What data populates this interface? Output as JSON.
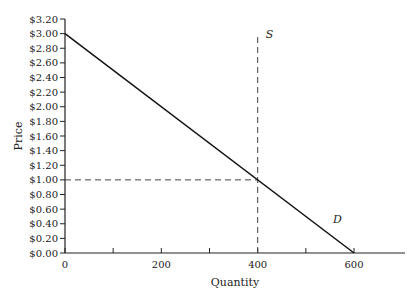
{
  "chart_data": {
    "type": "line",
    "title": "",
    "xlabel": "Quantity",
    "ylabel": "Price",
    "xlim": [
      0,
      700
    ],
    "ylim": [
      0,
      3.2
    ],
    "x_ticks": [
      0,
      100,
      200,
      300,
      400,
      500,
      600
    ],
    "x_tick_labels": [
      "0",
      "",
      "200",
      "",
      "400",
      "",
      "600"
    ],
    "y_ticks": [
      0,
      0.2,
      0.4,
      0.6,
      0.8,
      1.0,
      1.2,
      1.4,
      1.6,
      1.8,
      2.0,
      2.2,
      2.4,
      2.6,
      2.8,
      3.0,
      3.2
    ],
    "y_tick_labels": [
      "$0.00",
      "$0.20",
      "$0.40",
      "$0.60",
      "$0.80",
      "$1.00",
      "$1.20",
      "$1.40",
      "$1.60",
      "$1.80",
      "$2.00",
      "$2.20",
      "$2.40",
      "$2.60",
      "$2.80",
      "$3.00",
      "$3.20"
    ],
    "grid": false,
    "series": [
      {
        "name": "D",
        "style": "solid",
        "x": [
          0,
          600
        ],
        "y": [
          3.0,
          0.0
        ]
      },
      {
        "name": "S",
        "style": "dashed",
        "x": [
          400,
          400
        ],
        "y": [
          0.0,
          3.0
        ]
      }
    ],
    "reference_lines": [
      {
        "orientation": "horizontal",
        "y": 1.0,
        "x_from": 0,
        "x_to": 400,
        "style": "dashed"
      }
    ],
    "annotations": [
      {
        "text": "S",
        "x": 400,
        "y": 3.0
      },
      {
        "text": "D",
        "x": 540,
        "y": 0.4
      }
    ],
    "equilibrium": {
      "quantity": 400,
      "price": 1.0
    }
  }
}
